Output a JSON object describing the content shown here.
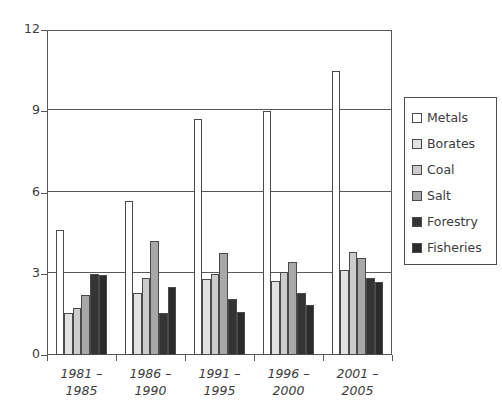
{
  "chart_data": {
    "type": "bar",
    "title": "",
    "subtitle": "",
    "xlabel": "",
    "ylabel": "",
    "ylim": [
      0,
      12
    ],
    "yticks": [
      0,
      3,
      6,
      9,
      12
    ],
    "ytick_labels": [
      "0",
      "3",
      "6",
      "9",
      "12"
    ],
    "grid": true,
    "legend_position": "right",
    "categories": [
      "1981 – 1985",
      "1986 – 1990",
      "1991 – 1995",
      "1996 – 2000",
      "2001 – 2005"
    ],
    "category_lines": [
      [
        "1981 –",
        "1985"
      ],
      [
        "1986 –",
        "1990"
      ],
      [
        "1991 –",
        "1995"
      ],
      [
        "1996 –",
        "2000"
      ],
      [
        "2001 –",
        "2005"
      ]
    ],
    "series": [
      {
        "name": "Metals",
        "color": "#ffffff",
        "values": [
          4.6,
          5.7,
          8.7,
          9.0,
          10.5
        ]
      },
      {
        "name": "Borates",
        "color": "#e2e2e2",
        "values": [
          1.55,
          2.3,
          2.8,
          2.75,
          3.15
        ]
      },
      {
        "name": "Coal",
        "color": "#cccccc",
        "values": [
          1.75,
          2.85,
          3.0,
          3.05,
          3.8
        ]
      },
      {
        "name": "Salt",
        "color": "#a8a8a8",
        "values": [
          2.2,
          4.2,
          3.75,
          3.45,
          3.6
        ]
      },
      {
        "name": "Forestry",
        "color": "#343434",
        "values": [
          3.0,
          1.55,
          2.05,
          2.3,
          2.85
        ]
      },
      {
        "name": "Fisheries",
        "color": "#2b2b2b",
        "values": [
          2.95,
          2.5,
          1.6,
          1.85,
          2.7
        ]
      }
    ]
  },
  "legend": {
    "items": [
      {
        "label": "Metals"
      },
      {
        "label": "Borates"
      },
      {
        "label": "Coal"
      },
      {
        "label": "Salt"
      },
      {
        "label": "Forestry"
      },
      {
        "label": "Fisheries"
      }
    ]
  },
  "colors": {
    "axis": "#58585a",
    "text": "#3b3b3d",
    "background": "#ffffff"
  }
}
